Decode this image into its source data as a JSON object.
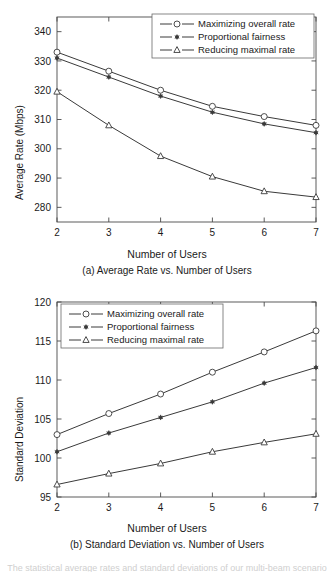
{
  "figure": {
    "background": "#ffffff",
    "ink_color": "#3a3a3a",
    "bottom_clipped_text": "The statistical average rates and standard deviations of our multi-beam scenario"
  },
  "chart_data": [
    {
      "id": "panel-a",
      "type": "line",
      "title": "",
      "caption": "(a) Average Rate vs. Number of Users",
      "xlabel": "Number of Users",
      "ylabel": "Average Rate (Mbps)",
      "x": [
        2,
        3,
        4,
        5,
        6,
        7
      ],
      "xticklabels": [
        "2",
        "3",
        "4",
        "5",
        "6",
        "7"
      ],
      "xlim": [
        2,
        7
      ],
      "ylim": [
        275,
        345
      ],
      "yticks": [
        280,
        290,
        300,
        310,
        320,
        330,
        340
      ],
      "yticklabels": [
        "280",
        "290",
        "300",
        "310",
        "320",
        "330",
        "340"
      ],
      "grid": false,
      "legend_position": "top-right",
      "series": [
        {
          "name": "Maximizing overall rate",
          "marker": "circle-open",
          "values": [
            333.0,
            326.5,
            320.0,
            314.5,
            311.0,
            308.0
          ]
        },
        {
          "name": "Proportional fairness",
          "marker": "asterisk-filled",
          "values": [
            331.0,
            324.5,
            318.0,
            312.5,
            308.5,
            305.5
          ]
        },
        {
          "name": "Reducing maximal rate",
          "marker": "triangle-open",
          "values": [
            319.5,
            308.0,
            297.5,
            290.5,
            285.5,
            283.5
          ]
        }
      ]
    },
    {
      "id": "panel-b",
      "type": "line",
      "title": "",
      "caption": "(b) Standard Deviation vs. Number of Users",
      "xlabel": "Number of Users",
      "ylabel": "Standard Deviation",
      "x": [
        2,
        3,
        4,
        5,
        6,
        7
      ],
      "xticklabels": [
        "2",
        "3",
        "4",
        "5",
        "6",
        "7"
      ],
      "xlim": [
        2,
        7
      ],
      "ylim": [
        95,
        120
      ],
      "yticks": [
        95,
        100,
        105,
        110,
        115,
        120
      ],
      "yticklabels": [
        "95",
        "100",
        "105",
        "110",
        "115",
        "120"
      ],
      "grid": false,
      "legend_position": "top-left",
      "series": [
        {
          "name": "Maximizing overall rate",
          "marker": "circle-open",
          "values": [
            103.0,
            105.7,
            108.2,
            111.0,
            113.6,
            116.3
          ]
        },
        {
          "name": "Proportional fairness",
          "marker": "asterisk-filled",
          "values": [
            100.8,
            103.2,
            105.2,
            107.2,
            109.6,
            111.6
          ]
        },
        {
          "name": "Reducing maximal rate",
          "marker": "triangle-open",
          "values": [
            96.6,
            98.0,
            99.3,
            100.8,
            102.0,
            103.1
          ]
        }
      ]
    }
  ]
}
